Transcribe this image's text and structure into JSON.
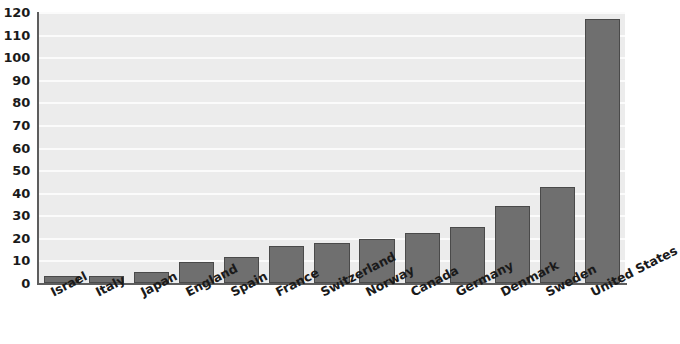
{
  "chart_data": {
    "type": "bar",
    "title": "",
    "subtitle": "",
    "xlabel": "",
    "ylabel": "",
    "categories": [
      "Israel",
      "Italy",
      "Japan",
      "England",
      "Spain",
      "France",
      "Switzerland",
      "Norway",
      "Canada",
      "Germany",
      "Denmark",
      "Sweden",
      "United States"
    ],
    "values": [
      3,
      3,
      5,
      9.5,
      11.5,
      16.5,
      17.5,
      19.5,
      22,
      25,
      34,
      42.5,
      117
    ],
    "ylim": [
      0,
      120
    ],
    "ytick_step": 10,
    "yticks": [
      0,
      10,
      20,
      30,
      40,
      50,
      60,
      70,
      80,
      90,
      100,
      110,
      120
    ],
    "ytick_labels": [
      "0",
      "10",
      "20",
      "30",
      "40",
      "50",
      "60",
      "70",
      "80",
      "90",
      "100",
      "110",
      "120"
    ],
    "grid": true,
    "legend": false,
    "legend_position": "none",
    "bar_color": "#6f6f6f",
    "bar_edge_color": "#4a4a4a",
    "plot_background": "#ececec",
    "gridline_color": "#fbfbfb",
    "axis_color": "#5d5d5d",
    "text_color": "#1a1a1a",
    "x_label_rotation": -27
  }
}
